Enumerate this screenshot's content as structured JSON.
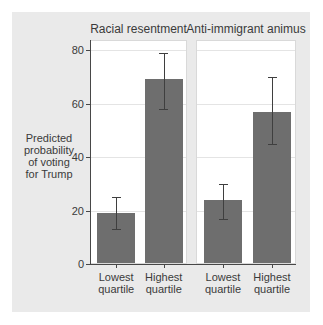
{
  "chart_data": {
    "type": "bar",
    "title": "",
    "ylabel": "Predicted probability of voting for Trump",
    "ylabel_display": "Predicted\nprobability\nof voting\nfor Trump",
    "ylim": [
      0,
      80
    ],
    "yticks": [
      0,
      20,
      40,
      60,
      80
    ],
    "grid": true,
    "legend": "none",
    "error_bars": true,
    "categories": [
      "Lowest quartile",
      "Highest quartile"
    ],
    "categories_display": [
      "Lowest\nquartile",
      "Highest\nquartile"
    ],
    "panels": [
      {
        "title": "Racial resentment",
        "series": [
          {
            "category": "Lowest quartile",
            "value": 19,
            "ci_low": 13,
            "ci_high": 25
          },
          {
            "category": "Highest quartile",
            "value": 69,
            "ci_low": 58,
            "ci_high": 79
          }
        ]
      },
      {
        "title": "Anti-immigrant animus",
        "series": [
          {
            "category": "Lowest quartile",
            "value": 24,
            "ci_low": 17,
            "ci_high": 30
          },
          {
            "category": "Highest quartile",
            "value": 57,
            "ci_low": 45,
            "ci_high": 70
          }
        ]
      }
    ],
    "colors": {
      "figure_background": "#eaeaea",
      "plot_background": "#ffffff",
      "bar": "#6e6e6e",
      "error_bar": "#3f3f3f",
      "gridline": "#e4e4e4",
      "axis": "#474747",
      "text": "#3a3a3a",
      "panel_border": "#d9d9d9"
    }
  }
}
